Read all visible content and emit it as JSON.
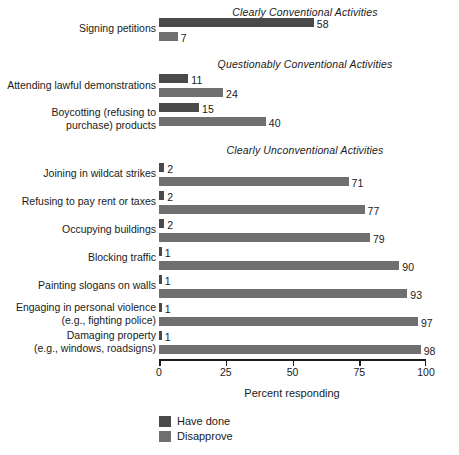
{
  "chart_data": {
    "type": "bar",
    "title": "",
    "orientation": "horizontal",
    "xlabel": "Percent responding",
    "ylabel": "",
    "xlim": [
      0,
      100
    ],
    "xticks": [
      "0",
      "25",
      "50",
      "75",
      "100"
    ],
    "xtick_values": [
      0,
      25,
      50,
      75,
      100
    ],
    "grid": false,
    "legend_position": "bottom-left",
    "series": [
      {
        "name": "Have done",
        "color": "#4a4a4a",
        "values": [
          58,
          11,
          15,
          2,
          2,
          2,
          1,
          1,
          1,
          1
        ]
      },
      {
        "name": "Disapprove",
        "color": "#6f6f6f",
        "values": [
          7,
          24,
          40,
          71,
          77,
          79,
          90,
          93,
          97,
          98
        ]
      }
    ],
    "categories": [
      "Signing petitions",
      "Attending lawful demonstrations",
      "Boycotting (refusing to\npurchase) products",
      "Joining in wildcat strikes",
      "Refusing to pay rent or taxes",
      "Occupying buildings",
      "Blocking traffic",
      "Painting slogans on walls",
      "Engaging in personal violence\n(e.g., fighting police)",
      "Damaging property\n(e.g., windows, roadsigns)"
    ],
    "groups": [
      {
        "heading": "Clearly Conventional Activities",
        "heading_center_x": 305,
        "heading_y": 6,
        "rows": [
          {
            "label": "Signing petitions",
            "label_y": 22,
            "have": 58,
            "have_y": 18,
            "disapprove": 7,
            "disapprove_y": 32
          }
        ]
      },
      {
        "heading": "Questionably Conventional Activities",
        "heading_center_x": 305,
        "heading_y": 58,
        "rows": [
          {
            "label": "Attending lawful demonstrations",
            "label_y": 79,
            "have": 11,
            "have_y": 74,
            "disapprove": 24,
            "disapprove_y": 88
          },
          {
            "label": "Boycotting (refusing to\npurchase) products",
            "label_y": 106,
            "have": 15,
            "have_y": 103,
            "disapprove": 40,
            "disapprove_y": 117
          }
        ]
      },
      {
        "heading": "Clearly Unconventional Activities",
        "heading_center_x": 305,
        "heading_y": 144,
        "rows": [
          {
            "label": "Joining in wildcat strikes",
            "label_y": 167,
            "have": 2,
            "have_y": 163,
            "disapprove": 71,
            "disapprove_y": 177
          },
          {
            "label": "Refusing to pay rent or taxes",
            "label_y": 195,
            "have": 2,
            "have_y": 191,
            "disapprove": 77,
            "disapprove_y": 205
          },
          {
            "label": "Occupying buildings",
            "label_y": 223,
            "have": 2,
            "have_y": 219,
            "disapprove": 79,
            "disapprove_y": 233
          },
          {
            "label": "Blocking traffic",
            "label_y": 251,
            "have": 1,
            "have_y": 247,
            "disapprove": 90,
            "disapprove_y": 261
          },
          {
            "label": "Painting slogans on walls",
            "label_y": 279,
            "have": 1,
            "have_y": 275,
            "disapprove": 93,
            "disapprove_y": 289
          },
          {
            "label": "Engaging in personal violence\n(e.g., fighting police)",
            "label_y": 301,
            "have": 1,
            "have_y": 303,
            "disapprove": 97,
            "disapprove_y": 317
          },
          {
            "label": "Damaging property\n(e.g., windows, roadsigns)",
            "label_y": 329,
            "have": 1,
            "have_y": 331,
            "disapprove": 98,
            "disapprove_y": 345
          }
        ]
      }
    ]
  },
  "axis": {
    "title": "Percent responding",
    "title_y": 387,
    "title_center_x": 292,
    "line_y": 359,
    "line_left": 159,
    "line_right": 426,
    "tick_label_y": 366,
    "ticks": [
      {
        "label": "0",
        "value": 0
      },
      {
        "label": "25",
        "value": 25
      },
      {
        "label": "50",
        "value": 50
      },
      {
        "label": "75",
        "value": 75
      },
      {
        "label": "100",
        "value": 100
      }
    ]
  },
  "legend": {
    "left": 159,
    "top": 415,
    "items": [
      {
        "label": "Have done",
        "color": "#4a4a4a",
        "y": 0
      },
      {
        "label": "Disapprove",
        "color": "#6f6f6f",
        "y": 15
      }
    ]
  },
  "colors": {
    "have_done": "#4a4a4a",
    "disapprove": "#6f6f6f",
    "axis": "#1a1a1a",
    "text": "#1a1a1a",
    "background": "#ffffff"
  }
}
